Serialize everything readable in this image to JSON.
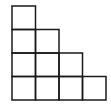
{
  "diagram": {
    "type": "staircase-grid",
    "stroke_color": "#1a1a1a",
    "background": "#ffffff",
    "cell_size": 23.5,
    "origin": {
      "x": 12,
      "y": 6
    },
    "rows": [
      {
        "row": 1,
        "cells": 1
      },
      {
        "row": 2,
        "cells": 2
      },
      {
        "row": 3,
        "cells": 3
      },
      {
        "row": 4,
        "cells": 4
      }
    ],
    "total_squares": 10
  }
}
